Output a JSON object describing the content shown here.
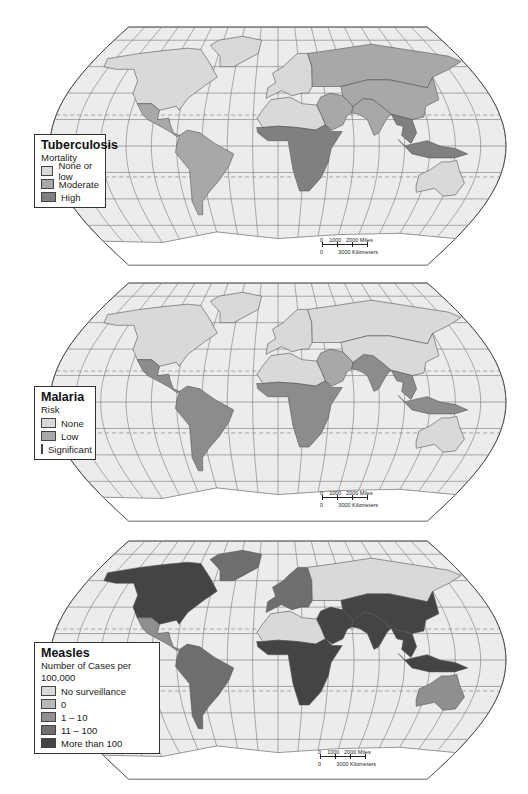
{
  "maps": [
    {
      "id": "tuberculosis",
      "legend": {
        "title": "Tuberculosis",
        "subtitle": "Mortality",
        "items": [
          {
            "label": "None or low",
            "color": "#d9d9d9"
          },
          {
            "label": "Moderate",
            "color": "#a8a8a8"
          },
          {
            "label": "High",
            "color": "#808080"
          }
        ]
      },
      "scale": {
        "miles_label": "0    1000   2000 Miles",
        "km_label": "0         3000 Kilometers",
        "m0": "0",
        "m1": "1000",
        "m2": "2000 Miles",
        "k0": "0",
        "k1": "3000 Kilometers"
      },
      "region_colors": {
        "north_america": "#d9d9d9",
        "central_america": "#a8a8a8",
        "south_america": "#a8a8a8",
        "europe": "#d9d9d9",
        "russia": "#a8a8a8",
        "north_africa": "#d9d9d9",
        "subsaharan_africa": "#808080",
        "middle_east": "#a8a8a8",
        "south_asia": "#a8a8a8",
        "east_asia": "#a8a8a8",
        "southeast_asia": "#808080",
        "australia": "#d9d9d9",
        "greenland": "#d9d9d9",
        "antarctica": "#ffffff"
      }
    },
    {
      "id": "malaria",
      "legend": {
        "title": "Malaria",
        "subtitle": "Risk",
        "items": [
          {
            "label": "None",
            "color": "#d9d9d9"
          },
          {
            "label": "Low",
            "color": "#a8a8a8"
          },
          {
            "label": "Significant",
            "color": "#8c8c8c"
          }
        ]
      },
      "scale": {
        "m0": "0",
        "m1": "1000",
        "m2": "2000 Miles",
        "k0": "0",
        "k1": "3000 Kilometers"
      },
      "region_colors": {
        "north_america": "#d9d9d9",
        "central_america": "#8c8c8c",
        "south_america": "#8c8c8c",
        "europe": "#d9d9d9",
        "russia": "#d9d9d9",
        "north_africa": "#d9d9d9",
        "subsaharan_africa": "#8c8c8c",
        "middle_east": "#a8a8a8",
        "south_asia": "#8c8c8c",
        "east_asia": "#d9d9d9",
        "southeast_asia": "#8c8c8c",
        "australia": "#d9d9d9",
        "greenland": "#d9d9d9",
        "antarctica": "#ffffff"
      }
    },
    {
      "id": "measles",
      "legend": {
        "title": "Measles",
        "subtitle": "Number of Cases per 100,000",
        "items": [
          {
            "label": "No surveillance",
            "color": "#d9d9d9"
          },
          {
            "label": "0",
            "color": "#b8b8b8"
          },
          {
            "label": "1 – 10",
            "color": "#8f8f8f"
          },
          {
            "label": "11 – 100",
            "color": "#6e6e6e"
          },
          {
            "label": "More than 100",
            "color": "#444444"
          }
        ]
      },
      "scale": {
        "m0": "0",
        "m1": "1000",
        "m2": "2000 Miles",
        "k0": "0",
        "k1": "3000 Kilometers"
      },
      "region_colors": {
        "north_america": "#444444",
        "central_america": "#8f8f8f",
        "south_america": "#6e6e6e",
        "europe": "#6e6e6e",
        "russia": "#d9d9d9",
        "north_africa": "#d9d9d9",
        "subsaharan_africa": "#444444",
        "middle_east": "#444444",
        "south_asia": "#444444",
        "east_asia": "#444444",
        "southeast_asia": "#444444",
        "australia": "#8f8f8f",
        "greenland": "#6e6e6e",
        "antarctica": "#ffffff"
      }
    }
  ]
}
